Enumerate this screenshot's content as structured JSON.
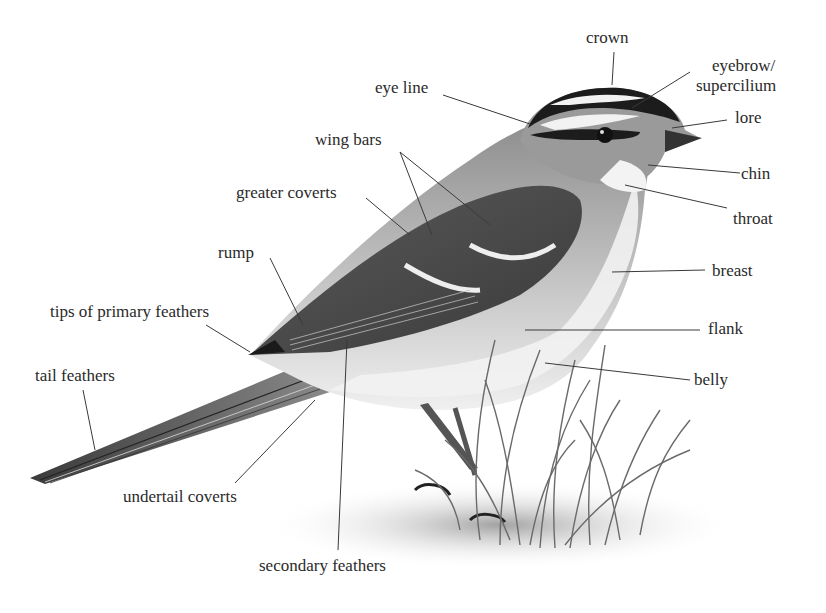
{
  "diagram": {
    "labels": {
      "crown": "crown",
      "eyebrow_line1": "eyebrow/",
      "eyebrow_line2": "supercilium",
      "lore": "lore",
      "eye_line": "eye line",
      "wing_bars": "wing bars",
      "chin": "chin",
      "throat": "throat",
      "greater_coverts": "greater coverts",
      "breast": "breast",
      "rump": "rump",
      "tips_of_primary_feathers": "tips of primary feathers",
      "flank": "flank",
      "tail_feathers": "tail feathers",
      "belly": "belly",
      "undertail_coverts": "undertail coverts",
      "secondary_feathers": "secondary feathers"
    },
    "colors": {
      "text": "#2a2a2a",
      "leader_line": "#3a3a3a",
      "bird_dark": "#1e1e1e",
      "bird_mid": "#7a7a7a",
      "bird_light": "#d8d8d8",
      "background": "#ffffff"
    }
  }
}
